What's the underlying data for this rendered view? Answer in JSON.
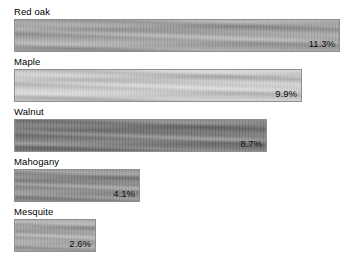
{
  "chart_data": {
    "type": "bar",
    "orientation": "horizontal",
    "title": "",
    "xlabel": "",
    "ylabel": "",
    "categories": [
      "Red oak",
      "Maple",
      "Walnut",
      "Mahogany",
      "Mesquite"
    ],
    "values": [
      11.3,
      9.9,
      8.7,
      4.1,
      2.6
    ],
    "value_labels": [
      "11.3%",
      "9.9%",
      "8.7%",
      "4.1%",
      "2.6%"
    ],
    "xlim": [
      0,
      11.3
    ],
    "grid": false,
    "legend": false,
    "bar_fill": "wood-grain-texture",
    "series": [
      {
        "name": "Share",
        "values": [
          11.3,
          9.9,
          8.7,
          4.1,
          2.6
        ]
      }
    ],
    "bars": [
      {
        "label": "Red oak",
        "value": 11.3,
        "value_label": "11.3%",
        "width_px": 326,
        "color": "#a5a5a5",
        "texture": "wood-grain"
      },
      {
        "label": "Maple",
        "value": 9.9,
        "value_label": "9.9%",
        "width_px": 288,
        "color": "#d2d2d2",
        "texture": "wood-grain"
      },
      {
        "label": "Walnut",
        "value": 8.7,
        "value_label": "8.7%",
        "width_px": 253,
        "color": "#767676",
        "texture": "wood-grain"
      },
      {
        "label": "Mahogany",
        "value": 4.1,
        "value_label": "4.1%",
        "width_px": 126,
        "color": "#8c8c8c",
        "texture": "wood-grain"
      },
      {
        "label": "Mesquite",
        "value": 2.6,
        "value_label": "2.6%",
        "width_px": 82,
        "color": "#a8a8a8",
        "texture": "wood-grain"
      }
    ],
    "background": "#ffffff",
    "border_color": "#8e8e8e",
    "text_color": "#000000"
  }
}
